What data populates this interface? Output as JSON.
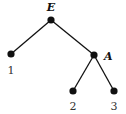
{
  "tree": {
    "nodes": [
      {
        "id": "root",
        "label": "E",
        "x": 51,
        "y": 20,
        "label_x": 51,
        "label_y": 11,
        "label_anchor": "middle"
      },
      {
        "id": "leaf1",
        "label": "1",
        "x": 11,
        "y": 54,
        "label_x": 11,
        "label_y": 74,
        "label_anchor": "middle"
      },
      {
        "id": "nodeA",
        "label": "A",
        "x": 94,
        "y": 55,
        "label_x": 104,
        "label_y": 60,
        "label_anchor": "start"
      },
      {
        "id": "leaf2",
        "label": "2",
        "x": 73,
        "y": 91,
        "label_x": 73,
        "label_y": 110,
        "label_anchor": "middle"
      },
      {
        "id": "leaf3",
        "label": "3",
        "x": 114,
        "y": 91,
        "label_x": 114,
        "label_y": 110,
        "label_anchor": "middle"
      }
    ],
    "edges": [
      {
        "from": "root",
        "to": "leaf1"
      },
      {
        "from": "root",
        "to": "nodeA"
      },
      {
        "from": "nodeA",
        "to": "leaf2"
      },
      {
        "from": "nodeA",
        "to": "leaf3"
      }
    ]
  }
}
